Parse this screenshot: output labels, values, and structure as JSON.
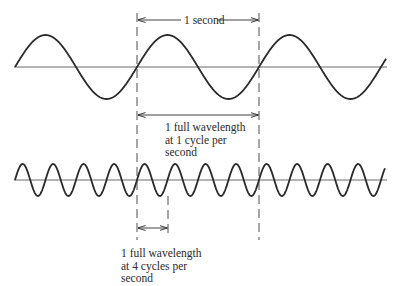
{
  "diagram": {
    "title": "",
    "colors": {
      "ink": "#2a2a2a",
      "axis": "#6b6b6b",
      "background": "#ffffff"
    },
    "top_wave": {
      "frequency_label": "1 cycle per second",
      "cycles_shown": 3,
      "axis_y": 67,
      "amplitude": 32,
      "period_px": 122,
      "x_start": 15,
      "x_end": 386
    },
    "bottom_wave": {
      "frequency_label": "4 cycles per second",
      "cycles_shown": 12,
      "axis_y": 180,
      "amplitude": 16,
      "period_px": 30.5,
      "x_start": 15,
      "x_end": 385
    },
    "annotations": {
      "one_second": "1 second",
      "wavelength_1cps": [
        "1 full wavelength",
        "at 1 cycle per",
        "second"
      ],
      "wavelength_4cps": [
        "1 full wavelength",
        "at 4 cycles per",
        "second"
      ]
    }
  }
}
